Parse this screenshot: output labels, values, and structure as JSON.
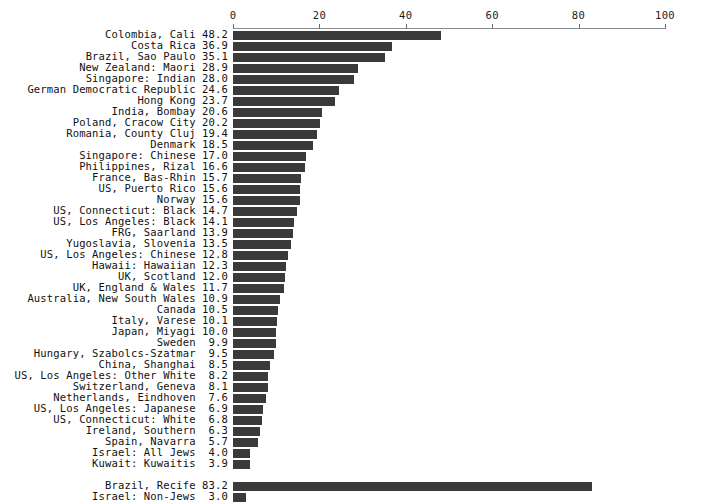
{
  "chart_data": {
    "type": "bar",
    "orientation": "horizontal",
    "title": "",
    "subtitle": "",
    "xlabel": "",
    "ylabel": "",
    "xlim": [
      0,
      100
    ],
    "grid": false,
    "legend": null,
    "axis_ticks": [
      "0",
      "20",
      "40",
      "60",
      "80",
      "100"
    ],
    "axis_tick_values": [
      0,
      20,
      40,
      60,
      80,
      100
    ],
    "bar_color": "#3a3a3a",
    "axis_color": "#8d8d8d",
    "text_color": "#111111",
    "categories": [
      "Colombia, Cali",
      "Costa Rica",
      "Brazil, Sao Paulo",
      "New Zealand: Maori",
      "Singapore: Indian",
      "German Democratic Republic",
      "Hong Kong",
      "India, Bombay",
      "Poland, Cracow City",
      "Romania, County Cluj",
      "Denmark",
      "Singapore: Chinese",
      "Philippines, Rizal",
      "France, Bas-Rhin",
      "US, Puerto Rico",
      "Norway",
      "US, Connecticut: Black",
      "US, Los Angeles: Black",
      "FRG, Saarland",
      "Yugoslavia, Slovenia",
      "US, Los Angeles: Chinese",
      "Hawaii: Hawaiian",
      "UK, Scotland",
      "UK, England & Wales",
      "Australia, New South Wales",
      "Canada",
      "Italy, Varese",
      "Japan, Miyagi",
      "Sweden",
      "Hungary, Szabolcs-Szatmar",
      "China, Shanghai",
      "US, Los Angeles: Other White",
      "Switzerland, Geneva",
      "Netherlands, Eindhoven",
      "US, Los Angeles: Japanese",
      "US, Connecticut: White",
      "Ireland, Southern",
      "Spain, Navarra",
      "Israel: All Jews",
      "Kuwait: Kuwaitis",
      "Brazil, Recife",
      "Israel: Non-Jews"
    ],
    "values": [
      48.2,
      36.9,
      35.1,
      28.9,
      28.0,
      24.6,
      23.7,
      20.6,
      20.2,
      19.4,
      18.5,
      17.0,
      16.6,
      15.7,
      15.6,
      15.6,
      14.7,
      14.1,
      13.9,
      13.5,
      12.8,
      12.3,
      12.0,
      11.7,
      10.9,
      10.5,
      10.1,
      10.0,
      9.9,
      9.5,
      8.5,
      8.2,
      8.1,
      7.6,
      6.9,
      6.8,
      6.3,
      5.7,
      4.0,
      3.9,
      83.2,
      3.0
    ],
    "value_labels": [
      "48.2",
      "36.9",
      "35.1",
      "28.9",
      "28.0",
      "24.6",
      "23.7",
      "20.6",
      "20.2",
      "19.4",
      "18.5",
      "17.0",
      "16.6",
      "15.7",
      "15.6",
      "15.6",
      "14.7",
      "14.1",
      "13.9",
      "13.5",
      "12.8",
      "12.3",
      "12.0",
      "11.7",
      "10.9",
      "10.5",
      "10.1",
      "10.0",
      "9.9",
      "9.5",
      "8.5",
      "8.2",
      "8.1",
      "7.6",
      "6.9",
      "6.8",
      "6.3",
      "5.7",
      "4.0",
      "3.9",
      "83.2",
      "3.0"
    ],
    "group_break_after_index": 39,
    "annotations": []
  }
}
